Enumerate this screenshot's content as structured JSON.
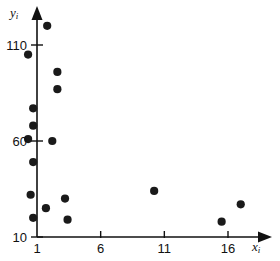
{
  "chart_data": {
    "type": "scatter",
    "title": "",
    "subtitle": "",
    "xlabel": "x_i",
    "ylabel": "y_i",
    "xlabel_base": "x",
    "xlabel_sub": "i",
    "ylabel_base": "y",
    "ylabel_sub": "i",
    "xlim": [
      0,
      17.8
    ],
    "ylim": [
      10,
      130
    ],
    "xticks": [
      1,
      6,
      11,
      16
    ],
    "xtick_labels": [
      "1",
      "6",
      "11",
      "16"
    ],
    "yticks": [
      10,
      60,
      110
    ],
    "ytick_labels": [
      "10",
      "60",
      "110"
    ],
    "grid": false,
    "legend": false,
    "legend_position": "none",
    "marker": "filled-circle",
    "marker_color": "#1a1a1a",
    "marker_size": 5,
    "axis_color": "#111111",
    "background_color": "#ffffff",
    "x": [
      1.8,
      0.3,
      2.6,
      2.6,
      0.7,
      0.7,
      0.3,
      2.2,
      0.7,
      0.5,
      3.2,
      1.7,
      0.7,
      3.4,
      10.2,
      17.0,
      15.5
    ],
    "y": [
      120,
      105,
      96,
      87,
      77,
      68,
      61,
      60,
      49,
      32,
      30,
      25,
      20,
      19,
      34,
      27,
      18
    ],
    "points": [
      {
        "x": 1.8,
        "y": 120
      },
      {
        "x": 0.3,
        "y": 105
      },
      {
        "x": 2.6,
        "y": 96
      },
      {
        "x": 2.6,
        "y": 87
      },
      {
        "x": 0.7,
        "y": 77
      },
      {
        "x": 0.7,
        "y": 68
      },
      {
        "x": 0.3,
        "y": 61
      },
      {
        "x": 2.2,
        "y": 60
      },
      {
        "x": 0.7,
        "y": 49
      },
      {
        "x": 0.5,
        "y": 32
      },
      {
        "x": 3.2,
        "y": 30
      },
      {
        "x": 1.7,
        "y": 25
      },
      {
        "x": 0.7,
        "y": 20
      },
      {
        "x": 3.4,
        "y": 19
      },
      {
        "x": 10.2,
        "y": 34
      },
      {
        "x": 17.0,
        "y": 27
      },
      {
        "x": 15.5,
        "y": 18
      }
    ],
    "n_points": 17
  }
}
